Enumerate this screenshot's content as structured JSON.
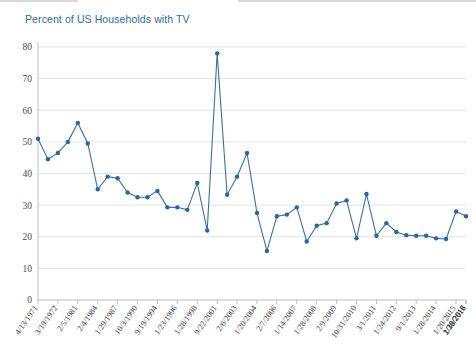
{
  "chart_data": {
    "type": "line",
    "title": "Percent of US Households with TV",
    "xlabel": "",
    "ylabel": "",
    "ylim": [
      0,
      80
    ],
    "yticks": [
      0,
      10,
      20,
      30,
      40,
      50,
      60,
      70,
      80
    ],
    "grid": true,
    "legend": "none",
    "series_color": "#2b63a6",
    "title_color": "#2e6aa8",
    "x_tick_labels": [
      "4/13/1971",
      "3/19/1972",
      "2/5/1981",
      "2/4/1984",
      "1/29/1987",
      "10/3/1990",
      "9/19/1994",
      "1/23/1996",
      "1/28/1998",
      "9/22/2001",
      "2/6/2003",
      "1/20/2004",
      "2/7/2006",
      "1/14/2007",
      "1/28/2008",
      "2/9/2009",
      "10/31/2010",
      "3/1/2011",
      "1/24/2012",
      "9/1/2013",
      "1/28/2014",
      "1/20/2015",
      "1/12/2016",
      "2/28/2017",
      "1/30/2018"
    ],
    "values": [
      51.0,
      44.5,
      46.5,
      50.0,
      56.0,
      49.5,
      35.0,
      39.0,
      38.5,
      34.0,
      32.5,
      32.5,
      34.5,
      29.3,
      29.3,
      28.5,
      37.0,
      22.0,
      78.0,
      33.3,
      39.0,
      46.5,
      27.5,
      15.5,
      26.5,
      27.0,
      29.3,
      18.5,
      23.5,
      24.3,
      30.5,
      31.5,
      19.5,
      33.5,
      20.3,
      24.3,
      21.5,
      20.5,
      20.3,
      20.3,
      19.5,
      19.3,
      28.0,
      26.5
    ]
  }
}
